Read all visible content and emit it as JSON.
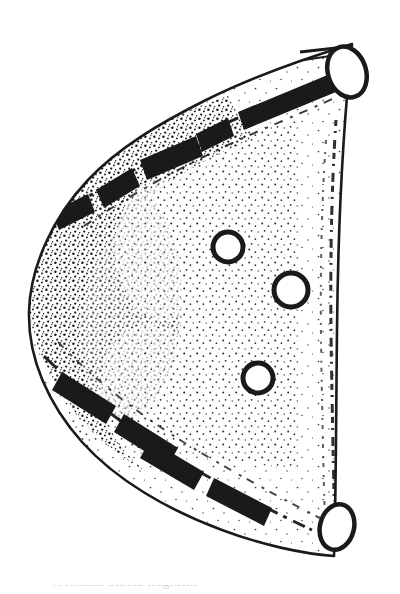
{
  "plate": {
    "label_text": "# 2",
    "label_icon": "hash-two-handwritten-label",
    "ink_color": "#1a1a1a",
    "paper_color": "#ffffff",
    "caption_remnant_text": "A Roman Shield fragment"
  },
  "drawing": {
    "name": "d-shaped-artifact-outline",
    "outline_icon": "artifact-silhouette-icon",
    "stipple_icon": "stipple-shading-icon",
    "perforations": [
      {
        "name": "apex-perforation-top",
        "cx": 347,
        "cy": 72,
        "rx": 19,
        "ry": 26,
        "rot": -18
      },
      {
        "name": "apex-perforation-bottom",
        "cx": 337,
        "cy": 527,
        "rx": 17,
        "ry": 23,
        "rot": 14
      }
    ],
    "interior_holes": [
      {
        "name": "interior-hole-upper",
        "cx": 228,
        "cy": 247,
        "r": 15
      },
      {
        "name": "interior-hole-middle",
        "cx": 291,
        "cy": 290,
        "r": 17
      },
      {
        "name": "interior-hole-lower",
        "cx": 258,
        "cy": 378,
        "r": 15
      }
    ],
    "dark_bands": [
      {
        "name": "rim-band-upper-right"
      },
      {
        "name": "rim-band-upper-inner"
      },
      {
        "name": "rim-band-lower-left"
      },
      {
        "name": "rim-band-lower-inner"
      }
    ]
  }
}
